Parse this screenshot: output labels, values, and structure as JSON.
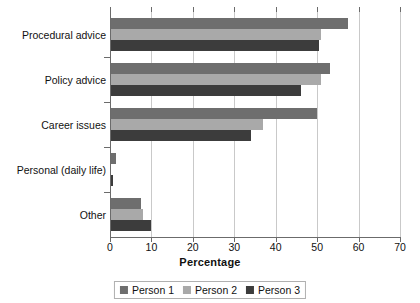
{
  "chart_data": {
    "type": "bar",
    "orientation": "horizontal",
    "title": "",
    "xlabel": "Percentage",
    "ylabel": "",
    "xlim": [
      0,
      70
    ],
    "xticks": [
      0,
      10,
      20,
      30,
      40,
      50,
      60,
      70
    ],
    "grid": "vertical",
    "legend_position": "bottom-center",
    "categories": [
      "Procedural advice",
      "Policy advice",
      "Career issues",
      "Personal (daily life)",
      "Other"
    ],
    "series": [
      {
        "name": "Person 1",
        "color": "#6e6e6e",
        "values": [
          57.5,
          53,
          50,
          1.5,
          7.5
        ]
      },
      {
        "name": "Person 2",
        "color": "#a9a9a9",
        "values": [
          51,
          51,
          37,
          0.3,
          8
        ]
      },
      {
        "name": "Person 3",
        "color": "#3c3c3c",
        "values": [
          50.5,
          46,
          34,
          0.8,
          10
        ]
      }
    ]
  },
  "axis": {
    "x_title": "Percentage",
    "tick_labels": [
      "0",
      "10",
      "20",
      "30",
      "40",
      "50",
      "60",
      "70"
    ]
  },
  "legend": {
    "items": [
      {
        "label": "Person 1",
        "color": "#6e6e6e"
      },
      {
        "label": "Person 2",
        "color": "#a9a9a9"
      },
      {
        "label": "Person 3",
        "color": "#3c3c3c"
      }
    ]
  }
}
